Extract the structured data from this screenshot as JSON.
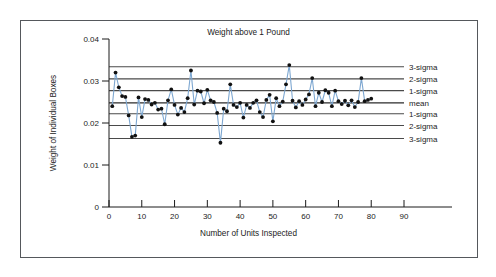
{
  "figure": {
    "background_color": "#ffffff",
    "border_color": "#55585c",
    "top_cut_text": ""
  },
  "chart_data": {
    "type": "line",
    "title": "Weight above 1 Pound",
    "xlabel": "Number of Units Inspected",
    "ylabel": "Weight of Individual Boxes",
    "xlim": [
      0,
      90
    ],
    "ylim": [
      0,
      0.04
    ],
    "xticks": [
      0,
      10,
      20,
      30,
      40,
      50,
      60,
      70,
      80,
      90
    ],
    "xtick_labels": [
      "0",
      "10",
      "20",
      "30",
      "40",
      "50",
      "60",
      "70",
      "80",
      "90"
    ],
    "yticks": [
      0,
      0.01,
      0.02,
      0.03,
      0.04
    ],
    "ytick_labels": [
      "0",
      "0.01",
      "0.02",
      "0.03",
      "0.04"
    ],
    "grid": false,
    "legend_position": "right-inline",
    "series_color": "#7da7d1",
    "marker_color": "#111111",
    "control_limits": [
      {
        "label": "3-sigma",
        "value": 0.0334,
        "side": "upper",
        "color": "#4a4a4a"
      },
      {
        "label": "2-sigma",
        "value": 0.0305,
        "side": "upper",
        "color": "#4a4a4a"
      },
      {
        "label": "1-sigma",
        "value": 0.0277,
        "side": "upper",
        "color": "#4a4a4a"
      },
      {
        "label": "mean",
        "value": 0.0248,
        "side": "center",
        "color": "#2b2b2b"
      },
      {
        "label": "1-sigma",
        "value": 0.0222,
        "side": "lower",
        "color": "#4a4a4a"
      },
      {
        "label": "2-sigma",
        "value": 0.0194,
        "side": "lower",
        "color": "#4a4a4a"
      },
      {
        "label": "3-sigma",
        "value": 0.0163,
        "side": "lower",
        "color": "#4a4a4a"
      }
    ],
    "x": [
      1,
      2,
      3,
      4,
      5,
      6,
      7,
      8,
      9,
      10,
      11,
      12,
      13,
      14,
      15,
      16,
      17,
      18,
      19,
      20,
      21,
      22,
      23,
      24,
      25,
      26,
      27,
      28,
      29,
      30,
      31,
      32,
      33,
      34,
      35,
      36,
      37,
      38,
      39,
      40,
      41,
      42,
      43,
      44,
      45,
      46,
      47,
      48,
      49,
      50,
      51,
      52,
      53,
      54,
      55,
      56,
      57,
      58,
      59,
      60,
      61,
      62,
      63,
      64,
      65,
      66,
      67,
      68,
      69,
      70,
      71,
      72,
      73,
      74,
      75,
      76,
      77,
      78,
      79,
      80
    ],
    "values": [
      0.024,
      0.032,
      0.0285,
      0.0264,
      0.0262,
      0.0218,
      0.0167,
      0.017,
      0.0261,
      0.0214,
      0.0257,
      0.0255,
      0.0244,
      0.0248,
      0.0232,
      0.0234,
      0.0197,
      0.0254,
      0.028,
      0.0243,
      0.022,
      0.0236,
      0.0226,
      0.0259,
      0.0325,
      0.0244,
      0.0277,
      0.0275,
      0.0247,
      0.0279,
      0.0254,
      0.025,
      0.0224,
      0.0153,
      0.0234,
      0.0228,
      0.0292,
      0.0243,
      0.0238,
      0.0248,
      0.0213,
      0.0243,
      0.0236,
      0.0248,
      0.0254,
      0.0226,
      0.0214,
      0.0255,
      0.0267,
      0.0204,
      0.0259,
      0.024,
      0.0251,
      0.0292,
      0.0338,
      0.0253,
      0.0237,
      0.0252,
      0.0243,
      0.0256,
      0.0268,
      0.0307,
      0.024,
      0.0272,
      0.025,
      0.0278,
      0.0272,
      0.024,
      0.0277,
      0.0252,
      0.0245,
      0.0253,
      0.0242,
      0.0254,
      0.0238,
      0.025,
      0.0307,
      0.0252,
      0.0255,
      0.0258
    ]
  }
}
